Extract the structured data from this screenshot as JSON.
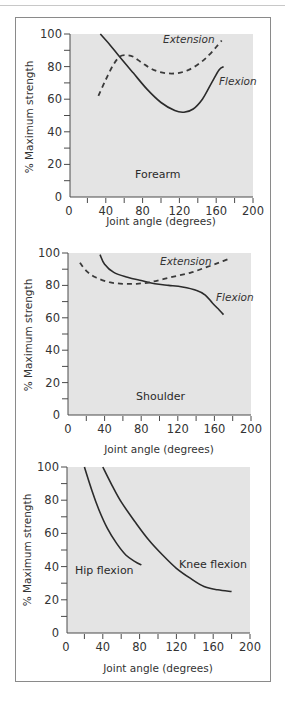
{
  "chart_data": [
    {
      "type": "line",
      "title": "Forearm",
      "xlabel": "Joint angle (degrees)",
      "ylabel": "% Maximum strength",
      "xlim": [
        0,
        200
      ],
      "ylim": [
        0,
        100
      ],
      "xticks": [
        0,
        40,
        80,
        120,
        160,
        200
      ],
      "yticks": [
        0,
        20,
        40,
        60,
        80,
        100
      ],
      "grid": false,
      "annotation": "Forearm",
      "series": [
        {
          "name": "Flexion",
          "style": "solid",
          "x": [
            34,
            45,
            55,
            70,
            85,
            100,
            115,
            125,
            135,
            145,
            155,
            163,
            168
          ],
          "y": [
            100,
            93,
            86,
            76,
            66,
            58,
            53,
            52,
            54,
            60,
            70,
            78,
            80
          ]
        },
        {
          "name": "Extension",
          "style": "dashed",
          "x": [
            32,
            40,
            48,
            55,
            62,
            70,
            80,
            92,
            105,
            118,
            130,
            142,
            152,
            160,
            166
          ],
          "y": [
            62,
            72,
            81,
            86,
            87,
            86,
            82,
            78,
            76,
            76,
            78,
            82,
            87,
            92,
            96
          ]
        }
      ]
    },
    {
      "type": "line",
      "title": "Shoulder",
      "xlabel": "Joint angle (degrees)",
      "ylabel": "% Maximum strength",
      "xlim": [
        0,
        200
      ],
      "ylim": [
        0,
        100
      ],
      "xticks": [
        0,
        40,
        80,
        120,
        160,
        200
      ],
      "yticks": [
        0,
        20,
        40,
        60,
        80,
        100
      ],
      "grid": false,
      "annotation": "Shoulder",
      "series": [
        {
          "name": "Flexion",
          "style": "solid",
          "x": [
            35,
            40,
            50,
            65,
            80,
            95,
            110,
            125,
            140,
            150,
            158,
            165,
            170
          ],
          "y": [
            99,
            93,
            88,
            85,
            83,
            81,
            80,
            79,
            77,
            74,
            69,
            65,
            62
          ]
        },
        {
          "name": "Extension",
          "style": "dashed",
          "x": [
            13,
            20,
            30,
            45,
            60,
            75,
            90,
            105,
            120,
            135,
            150,
            165,
            178
          ],
          "y": [
            94,
            89,
            85,
            82,
            81,
            81,
            82,
            84,
            86,
            88,
            91,
            94,
            97
          ]
        }
      ]
    },
    {
      "type": "line",
      "title": "Hip and knee flexion",
      "xlabel": "Joint angle (degrees)",
      "ylabel": "% Maximum strength",
      "xlim": [
        0,
        200
      ],
      "ylim": [
        0,
        100
      ],
      "xticks": [
        0,
        40,
        80,
        120,
        160,
        200
      ],
      "yticks": [
        0,
        20,
        40,
        60,
        80,
        100
      ],
      "grid": false,
      "series": [
        {
          "name": "Hip flexion",
          "style": "solid",
          "x": [
            20,
            28,
            36,
            45,
            55,
            65,
            75,
            82
          ],
          "y": [
            100,
            86,
            74,
            63,
            54,
            47,
            43,
            41
          ]
        },
        {
          "name": "Knee flexion",
          "style": "solid",
          "x": [
            40,
            50,
            60,
            75,
            90,
            105,
            120,
            135,
            150,
            165,
            180
          ],
          "y": [
            100,
            89,
            79,
            67,
            56,
            47,
            39,
            33,
            28,
            26,
            25
          ]
        }
      ]
    }
  ],
  "labels": {
    "y_title": "% Maximum strength",
    "x_title": "Joint angle (degrees)",
    "forearm": "Forearm",
    "shoulder": "Shoulder",
    "extension": "Extension",
    "flexion": "Flexion",
    "hip_flexion": "Hip flexion",
    "knee_flexion": "Knee flexion",
    "x_ticks": [
      "0",
      "40",
      "80",
      "120",
      "160",
      "200"
    ],
    "y_ticks": [
      "0",
      "20",
      "40",
      "60",
      "80",
      "100"
    ]
  },
  "colors": {
    "plot_background": "#e4e4e4",
    "line": "#2b2b2b",
    "panel_border": "#8a8a8a"
  }
}
